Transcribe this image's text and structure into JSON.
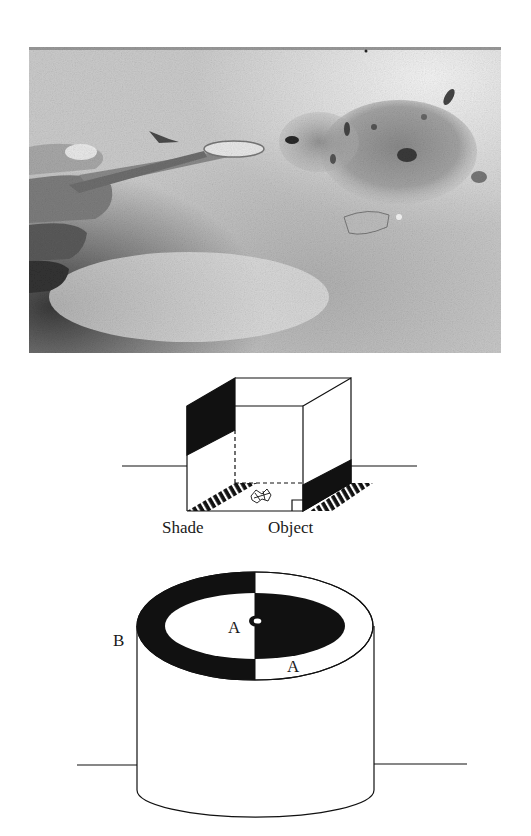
{
  "figure": {
    "panels": [
      {
        "id": "photo",
        "type": "photograph",
        "subject": "hand feeding chick with tweezers",
        "colors": {
          "background": "#c9c9c9",
          "highlight": "#eeeeee",
          "shadow": "#4a4a4a"
        }
      },
      {
        "id": "box-diagram",
        "type": "line-drawing",
        "labels": {
          "shade": "Shade",
          "object": "Object"
        },
        "colors": {
          "ink": "#111111",
          "fill": "#ffffff"
        }
      },
      {
        "id": "cylinder-diagram",
        "type": "line-drawing",
        "labels": {
          "b": "B",
          "a_center": "A",
          "a_rim": "A"
        },
        "colors": {
          "ink": "#111111",
          "fill": "#ffffff"
        }
      }
    ]
  }
}
